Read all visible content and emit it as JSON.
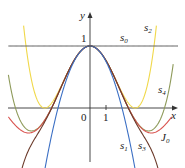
{
  "diagram": {
    "axes": {
      "x_label": "x",
      "y_label": "y",
      "origin_label": "0",
      "x_tick_label": "1",
      "y_tick_label": "1",
      "color": "#333333"
    },
    "curve_labels": {
      "s0": "s",
      "s0_sub": "0",
      "s1": "s",
      "s1_sub": "1",
      "s2": "s",
      "s2_sub": "2",
      "s3": "s",
      "s3_sub": "3",
      "s4": "s",
      "s4_sub": "4",
      "J0": "J",
      "J0_sub": "0"
    },
    "colors": {
      "s0": "#555555",
      "s1": "#3b6fc4",
      "s2": "#f0d84a",
      "s3": "#6b3a2a",
      "s4": "#8e9a5a",
      "J0": "#d9534f"
    }
  },
  "chart_data": {
    "type": "line",
    "title": "",
    "xlabel": "x",
    "ylabel": "y",
    "xlim": [
      -5.1,
      5.5
    ],
    "ylim": [
      -1.0,
      1.7
    ],
    "grid": false,
    "legend": "inline labels",
    "series": [
      {
        "name": "s0",
        "formula": "1",
        "x": [
          -5.1,
          5.5
        ],
        "y": [
          1,
          1
        ]
      },
      {
        "name": "s1",
        "formula": "1 - x^2/4",
        "x": [
          -3.7,
          -3,
          -2,
          -1,
          0,
          1,
          2,
          3,
          3.6
        ],
        "y": [
          -2.42,
          -1.25,
          0.0,
          0.75,
          1.0,
          0.75,
          0.0,
          -1.25,
          -2.24
        ]
      },
      {
        "name": "s2",
        "formula": "1 - x^2/4 + x^4/64",
        "x": [
          -4.1,
          -3,
          -2.5,
          -2,
          -1,
          0,
          1,
          2,
          2.5,
          3,
          4.1
        ],
        "y": [
          2.33,
          0.02,
          0.05,
          0.25,
          0.77,
          1.0,
          0.77,
          0.25,
          0.05,
          0.02,
          2.33
        ]
      },
      {
        "name": "s3",
        "formula": "s2 - x^6/2304",
        "x": [
          -4.5,
          -4,
          -3,
          -2,
          -1,
          0,
          1,
          2,
          3,
          4,
          4.5
        ],
        "y": [
          -1.24,
          -0.78,
          -0.3,
          0.22,
          0.77,
          1.0,
          0.77,
          0.22,
          -0.3,
          -0.78,
          -1.24
        ]
      },
      {
        "name": "s4",
        "formula": "s3 + x^8/147456",
        "x": [
          -5.1,
          -4.5,
          -4,
          -3,
          -2,
          -1,
          0,
          1,
          2,
          3,
          4,
          4.5,
          5.1
        ],
        "y": [
          0.19,
          -0.47,
          -0.33,
          -0.26,
          0.22,
          0.77,
          1.0,
          0.77,
          0.22,
          -0.26,
          -0.33,
          -0.47,
          0.19
        ]
      },
      {
        "name": "J0",
        "formula": "Bessel J0(x)",
        "x": [
          -5.1,
          -4,
          -3.83,
          -3,
          -2.405,
          -2,
          -1,
          0,
          1,
          2,
          2.405,
          3,
          3.83,
          4,
          5.1
        ],
        "y": [
          -0.15,
          -0.4,
          -0.4,
          -0.26,
          0.0,
          0.22,
          0.77,
          1.0,
          0.77,
          0.22,
          0.0,
          -0.26,
          -0.4,
          -0.4,
          -0.15
        ]
      }
    ],
    "annotations": [
      "s0",
      "s1",
      "s2",
      "s3",
      "s4",
      "J0"
    ]
  }
}
